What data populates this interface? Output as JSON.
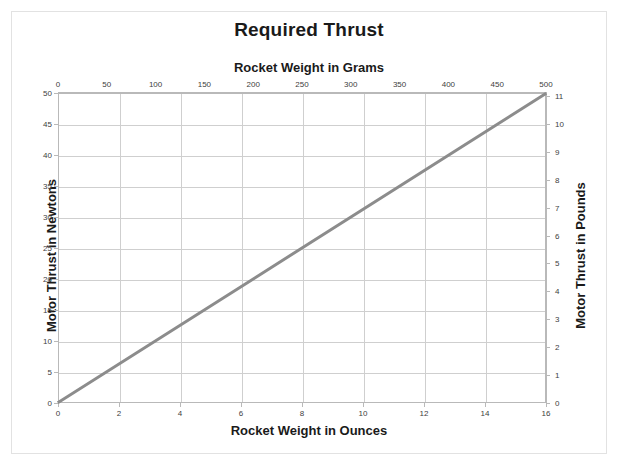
{
  "chart_data": {
    "type": "line",
    "title": "Required Thrust",
    "xlabel": "Rocket Weight in Ounces",
    "xlabel_top": "Rocket Weight in Grams",
    "ylabel": "Motor Thrust in Newtons",
    "ylabel_right": "Motor Thrust in Pounds",
    "grid": true,
    "legend": "none",
    "xlim": [
      0,
      16
    ],
    "ylim": [
      0,
      50
    ],
    "xlim_top": [
      0,
      500
    ],
    "ylim_right": [
      0,
      11
    ],
    "x_ticks": [
      0,
      2,
      4,
      6,
      8,
      10,
      12,
      14,
      16
    ],
    "x_ticks_top": [
      0,
      50,
      100,
      150,
      200,
      250,
      300,
      350,
      400,
      450,
      500
    ],
    "y_ticks": [
      0,
      5,
      10,
      15,
      20,
      25,
      30,
      35,
      40,
      45,
      50
    ],
    "y_ticks_right": [
      0,
      1,
      2,
      3,
      4,
      5,
      6,
      7,
      8,
      9,
      10,
      11
    ],
    "series": [
      {
        "name": "Required Thrust",
        "color": "#8c8c8c",
        "width": 3,
        "x": [
          0,
          16
        ],
        "values": [
          0,
          50
        ],
        "points": [
          {
            "x_oz": 0,
            "x_g": 0,
            "y_n": 0,
            "y_lb": 0
          },
          {
            "x_oz": 2,
            "x_g": 56.7,
            "y_n": 6.25,
            "y_lb": 1.4
          },
          {
            "x_oz": 4,
            "x_g": 113.4,
            "y_n": 12.5,
            "y_lb": 2.8
          },
          {
            "x_oz": 6,
            "x_g": 170.1,
            "y_n": 18.75,
            "y_lb": 4.2
          },
          {
            "x_oz": 8,
            "x_g": 226.8,
            "y_n": 25.0,
            "y_lb": 5.6
          },
          {
            "x_oz": 10,
            "x_g": 283.5,
            "y_n": 31.25,
            "y_lb": 7.0
          },
          {
            "x_oz": 12,
            "x_g": 340.2,
            "y_n": 37.5,
            "y_lb": 8.4
          },
          {
            "x_oz": 14,
            "x_g": 396.9,
            "y_n": 43.75,
            "y_lb": 9.8
          },
          {
            "x_oz": 16,
            "x_g": 453.6,
            "y_n": 50.0,
            "y_lb": 11.2
          }
        ]
      }
    ],
    "colors": {
      "line": "#8c8c8c",
      "grid": "#cfcfcf",
      "axis": "#b9b9b9",
      "text": "#1a1a1a",
      "tick_text": "#404040",
      "frame": "#e2e2e2",
      "background": "#ffffff"
    }
  }
}
